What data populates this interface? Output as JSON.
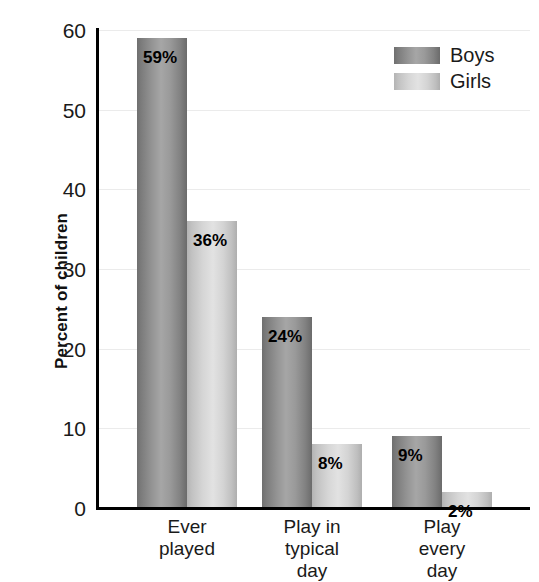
{
  "chart_data": {
    "type": "bar",
    "title": "",
    "subtitle": "",
    "xlabel": "",
    "ylabel": "Percent of children",
    "ylim": [
      0,
      60
    ],
    "yticks": [
      0,
      10,
      20,
      30,
      40,
      50,
      60
    ],
    "ytick_labels": [
      "0",
      "10",
      "20",
      "30",
      "40",
      "50",
      "60"
    ],
    "grid": true,
    "grid_axis": "y",
    "legend_position": "top-right",
    "categories": [
      "Ever played",
      "Play in typical day",
      "Play every day"
    ],
    "category_lines": [
      [
        "Ever",
        "played"
      ],
      [
        "Play in",
        "typical",
        "day"
      ],
      [
        "Play",
        "every",
        "day"
      ]
    ],
    "series": [
      {
        "name": "Boys",
        "color": "#949494",
        "values": [
          59,
          24,
          9
        ],
        "labels": [
          "59%",
          "24%",
          "9%"
        ]
      },
      {
        "name": "Girls",
        "color": "#d6d6d6",
        "values": [
          36,
          8,
          2
        ],
        "labels": [
          "36%",
          "8%",
          "2%"
        ]
      }
    ]
  },
  "axis": {
    "y_title": "Percent of children",
    "ticks": [
      {
        "label": "60",
        "value": 60
      },
      {
        "label": "50",
        "value": 50
      },
      {
        "label": "40",
        "value": 40
      },
      {
        "label": "30",
        "value": 30
      },
      {
        "label": "20",
        "value": 20
      },
      {
        "label": "10",
        "value": 10
      },
      {
        "label": "0",
        "value": 0
      }
    ]
  },
  "legend": {
    "items": [
      {
        "label": "Boys",
        "color": "#949494"
      },
      {
        "label": "Girls",
        "color": "#d6d6d6"
      }
    ]
  },
  "groups": [
    {
      "lines": [
        "Ever",
        "played"
      ],
      "boys_label": "59%",
      "girls_label": "36%"
    },
    {
      "lines": [
        "Play in",
        "typical",
        "day"
      ],
      "boys_label": "24%",
      "girls_label": "8%"
    },
    {
      "lines": [
        "Play",
        "every",
        "day"
      ],
      "boys_label": "9%",
      "girls_label": "2%"
    }
  ]
}
